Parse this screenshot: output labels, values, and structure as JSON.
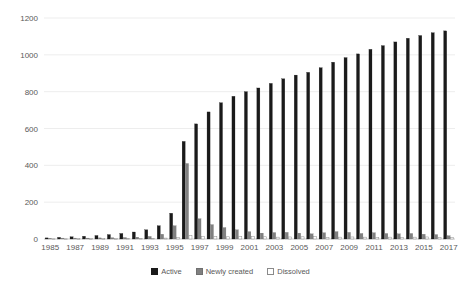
{
  "chart_data": {
    "type": "bar",
    "title": "",
    "subtitle": "",
    "xlabel": "",
    "ylabel": "",
    "ylim": [
      0,
      1200
    ],
    "ytick_values": [
      0,
      200,
      400,
      600,
      800,
      1000,
      1200
    ],
    "ytick_labels": [
      "0",
      "200",
      "400",
      "600",
      "800",
      "1000",
      "1200"
    ],
    "grid": true,
    "legend_position": "bottom-center",
    "categories": [
      "1985",
      "1986",
      "1987",
      "1988",
      "1989",
      "1990",
      "1991",
      "1992",
      "1993",
      "1994",
      "1995",
      "1996",
      "1997",
      "1998",
      "1999",
      "2000",
      "2001",
      "2002",
      "2003",
      "2004",
      "2005",
      "2006",
      "2007",
      "2008",
      "2009",
      "2010",
      "2011",
      "2012",
      "2013",
      "2014",
      "2015",
      "2016",
      "2017"
    ],
    "xtick_labels": [
      "1985",
      "1987",
      "1989",
      "1991",
      "1993",
      "1995",
      "1997",
      "1999",
      "2001",
      "2003",
      "2005",
      "2007",
      "2009",
      "2011",
      "2013",
      "2015",
      "2017"
    ],
    "series": [
      {
        "name": "Active",
        "color": "#1a1a1a",
        "values": [
          6,
          9,
          12,
          15,
          19,
          24,
          30,
          38,
          50,
          72,
          140,
          530,
          625,
          690,
          740,
          775,
          800,
          820,
          845,
          870,
          890,
          905,
          930,
          960,
          985,
          1005,
          1030,
          1050,
          1070,
          1090,
          1105,
          1120,
          1130
        ]
      },
      {
        "name": "Newly created",
        "color": "#808080",
        "values": [
          4,
          5,
          5,
          5,
          6,
          7,
          8,
          10,
          14,
          26,
          72,
          410,
          110,
          78,
          62,
          50,
          40,
          32,
          35,
          36,
          32,
          28,
          34,
          40,
          36,
          30,
          34,
          30,
          28,
          30,
          26,
          24,
          18
        ]
      },
      {
        "name": "Dissolved",
        "color": "#ffffff",
        "values": [
          1,
          1,
          2,
          2,
          2,
          2,
          3,
          3,
          4,
          5,
          8,
          20,
          15,
          13,
          12,
          15,
          15,
          12,
          10,
          11,
          12,
          13,
          9,
          10,
          11,
          10,
          9,
          10,
          8,
          10,
          11,
          9,
          8
        ]
      }
    ]
  },
  "legend": {
    "items": [
      {
        "label": "Active",
        "swatch": "filled-black-square"
      },
      {
        "label": "Newly created",
        "swatch": "filled-gray-square"
      },
      {
        "label": "Dissolved",
        "swatch": "outlined-white-square"
      }
    ]
  }
}
